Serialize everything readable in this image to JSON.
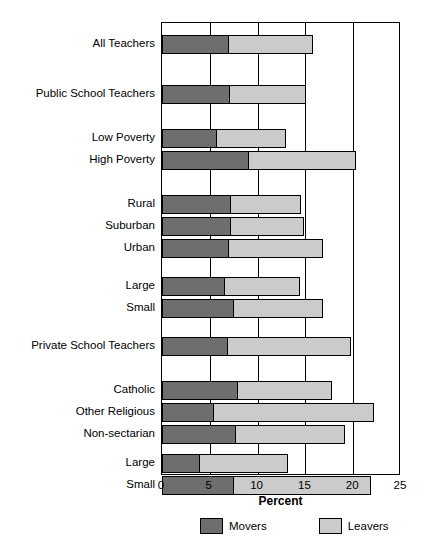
{
  "chart_data": {
    "type": "bar",
    "orientation": "horizontal",
    "stacked": true,
    "title": "",
    "xlabel": "Percent",
    "ylabel": "",
    "xlim": [
      0,
      25
    ],
    "xticks": [
      0,
      5,
      10,
      15,
      20,
      25
    ],
    "xtick_labels": [
      "0",
      "5",
      "10",
      "15",
      "20",
      "25"
    ],
    "grid": true,
    "legend_position": "bottom",
    "colors": {
      "movers": "#6e6e6e",
      "leavers": "#cbcbcb",
      "outline": "#000000"
    },
    "legend": [
      {
        "name": "Movers",
        "color": "#6e6e6e"
      },
      {
        "name": "Leavers",
        "color": "#cbcbcb"
      }
    ],
    "categories": [
      "All Teachers",
      "Public School Teachers",
      "Low Poverty",
      "High Poverty",
      "Rural",
      "Suburban",
      "Urban",
      "Large",
      "Small",
      "Private School Teachers",
      "Catholic",
      "Other Religious",
      "Non-sectarian",
      "Large",
      "Small"
    ],
    "series": [
      {
        "name": "Movers",
        "values": [
          7.0,
          7.1,
          5.8,
          9.1,
          7.2,
          7.2,
          7.0,
          6.6,
          7.5,
          6.9,
          8.0,
          5.4,
          7.7,
          4.0,
          7.5
        ]
      },
      {
        "name": "Leavers",
        "values": [
          8.8,
          8.0,
          7.2,
          11.2,
          7.3,
          7.7,
          9.8,
          7.8,
          9.3,
          12.9,
          9.8,
          16.8,
          11.4,
          9.2,
          14.4
        ]
      }
    ],
    "totals": [
      15.8,
      15.1,
      13.0,
      20.3,
      14.5,
      14.9,
      16.8,
      14.4,
      16.8,
      19.8,
      17.8,
      22.2,
      19.1,
      13.2,
      21.9
    ],
    "rows": [
      {
        "label": "All Teachers",
        "movers": 7.0,
        "leavers": 8.8,
        "total": 15.8,
        "top": 12
      },
      {
        "label": "Public School Teachers",
        "movers": 7.1,
        "leavers": 8.0,
        "total": 15.1,
        "top": 62
      },
      {
        "label": "Low Poverty",
        "movers": 5.8,
        "leavers": 7.2,
        "total": 13.0,
        "top": 106
      },
      {
        "label": "High Poverty",
        "movers": 9.1,
        "leavers": 11.2,
        "total": 20.3,
        "top": 128
      },
      {
        "label": "Rural",
        "movers": 7.2,
        "leavers": 7.3,
        "total": 14.5,
        "top": 172
      },
      {
        "label": "Suburban",
        "movers": 7.2,
        "leavers": 7.7,
        "total": 14.9,
        "top": 194
      },
      {
        "label": "Urban",
        "movers": 7.0,
        "leavers": 9.8,
        "total": 16.8,
        "top": 216
      },
      {
        "label": "Large",
        "movers": 6.6,
        "leavers": 7.8,
        "total": 14.4,
        "top": 254
      },
      {
        "label": "Small",
        "movers": 7.5,
        "leavers": 9.3,
        "total": 16.8,
        "top": 276
      },
      {
        "label": "Private School Teachers",
        "movers": 6.9,
        "leavers": 12.9,
        "total": 19.8,
        "top": 314
      },
      {
        "label": "Catholic",
        "movers": 8.0,
        "leavers": 9.8,
        "total": 17.8,
        "top": 358
      },
      {
        "label": "Other Religious",
        "movers": 5.4,
        "leavers": 16.8,
        "total": 22.2,
        "top": 380
      },
      {
        "label": "Non-sectarian",
        "movers": 7.7,
        "leavers": 11.4,
        "total": 19.1,
        "top": 402
      },
      {
        "label": "Large",
        "movers": 4.0,
        "leavers": 9.2,
        "total": 13.2,
        "top": 431
      },
      {
        "label": "Small",
        "movers": 7.5,
        "leavers": 14.4,
        "total": 21.9,
        "top": 453
      }
    ]
  }
}
